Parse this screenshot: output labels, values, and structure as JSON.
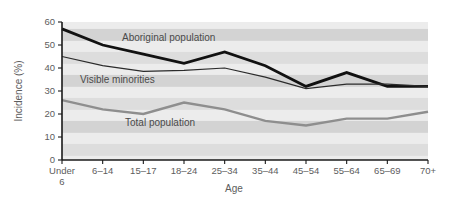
{
  "chart_data": {
    "type": "line",
    "title": "",
    "xlabel": "Age",
    "ylabel": "Incidence (%)",
    "categories": [
      "Under 6",
      "6–14",
      "15–17",
      "18–24",
      "25–34",
      "35–44",
      "45–54",
      "55–64",
      "65–69",
      "70+"
    ],
    "category_lines": [
      [
        "Under",
        "6"
      ],
      [
        "6–14"
      ],
      [
        "15–17"
      ],
      [
        "18–24"
      ],
      [
        "25–34"
      ],
      [
        "35–44"
      ],
      [
        "45–54"
      ],
      [
        "55–64"
      ],
      [
        "65–69"
      ],
      [
        "70+"
      ]
    ],
    "ylim": [
      0,
      60
    ],
    "yticks": [
      0,
      10,
      20,
      30,
      40,
      50,
      60
    ],
    "ytick_labels": [
      "0",
      "10",
      "20",
      "30",
      "40",
      "50",
      "60"
    ],
    "grid": "horizontal-bands",
    "legend_position": "inline-annotations",
    "series": [
      {
        "name": "Aboriginal population",
        "color": "#111111",
        "width": 2.8,
        "label_x": 122,
        "label_y": 41,
        "values": [
          57,
          50,
          46,
          42,
          47,
          41,
          32,
          38,
          32,
          32
        ]
      },
      {
        "name": "Visible minorities",
        "color": "#2b2b2b",
        "width": 1.2,
        "label_x": 80,
        "label_y": 83,
        "values": [
          45,
          41,
          38.5,
          39,
          40,
          36,
          31,
          33,
          33,
          32
        ]
      },
      {
        "name": "Total population",
        "color": "#8e8e8e",
        "width": 2.4,
        "label_x": 125,
        "label_y": 126,
        "values": [
          26,
          22,
          20,
          25,
          22,
          17,
          15,
          18,
          18,
          21
        ]
      }
    ],
    "band_colors": [
      "#ececec",
      "#d3d3d3"
    ],
    "plot_background": "#e6e6e6"
  },
  "axes": {
    "y_title": "Incidence (%)",
    "x_title": "Age"
  },
  "layout": {
    "plot_left": 62,
    "plot_right": 428,
    "plot_top": 22,
    "plot_bottom": 160
  }
}
